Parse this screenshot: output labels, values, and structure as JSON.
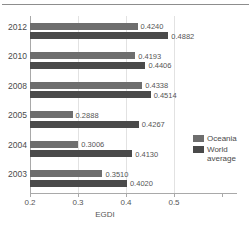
{
  "chart_data": {
    "type": "bar",
    "orientation": "horizontal",
    "title": "",
    "xlabel": "EGDI",
    "ylabel": "",
    "categories": [
      "2012",
      "2010",
      "2008",
      "2005",
      "2004",
      "2003"
    ],
    "series": [
      {
        "name": "Oceania",
        "color": "#6e6e6e",
        "values": [
          0.424,
          0.4193,
          0.4338,
          0.2888,
          0.3006,
          0.351
        ],
        "labels": [
          "0.4240",
          "0.4193",
          "0.4338",
          "0.2888",
          "0.3006",
          "0.3510"
        ]
      },
      {
        "name": "World average",
        "color": "#4a4a4a",
        "values": [
          0.4882,
          0.4406,
          0.4514,
          0.4267,
          0.413,
          0.402
        ],
        "labels": [
          "0.4882",
          "0.4406",
          "0.4514",
          "0.4267",
          "0.4130",
          "0.4020"
        ]
      }
    ],
    "xlim": [
      0.2,
      0.6
    ],
    "xticks": [
      0.2,
      0.3,
      0.4,
      0.5
    ],
    "xtick_labels": [
      "0.2",
      "0.3",
      "0.4",
      "0.5"
    ],
    "grid": "vertical",
    "legend_position": "right-middle"
  },
  "legend": {
    "entries": [
      {
        "label": "Oceania"
      },
      {
        "label": "World\naverage"
      }
    ]
  }
}
